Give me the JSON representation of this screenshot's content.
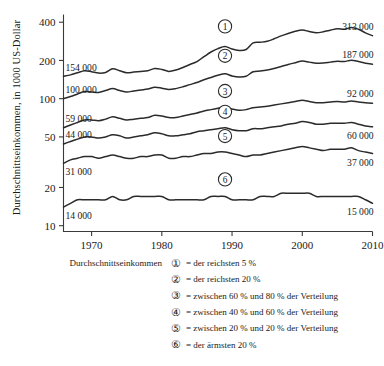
{
  "chart_data": {
    "type": "line",
    "title": "",
    "xlabel": "",
    "ylabel": "Durchschnittseinkommen, in 1000 US-Dollar",
    "xlim": [
      1966,
      2010
    ],
    "ylim": [
      9,
      460
    ],
    "yscale": "log",
    "grid": false,
    "legend_position": "below",
    "xticks": [
      "1970",
      "1980",
      "1990",
      "2000",
      "2010"
    ],
    "xtick_values": [
      1970,
      1980,
      1990,
      2000,
      2010
    ],
    "yticks": [
      "10",
      "20",
      "50",
      "100",
      "200",
      "400"
    ],
    "ytick_values": [
      10,
      20,
      50,
      100,
      200,
      400
    ],
    "series": [
      {
        "name": "1",
        "marker_label": "1",
        "start_label": "154 000",
        "end_label": "313 000",
        "start_value": 154,
        "end_value": 313,
        "x": [
          1966,
          1967,
          1968,
          1969,
          1970,
          1971,
          1972,
          1973,
          1974,
          1975,
          1976,
          1977,
          1978,
          1979,
          1980,
          1981,
          1982,
          1983,
          1984,
          1985,
          1986,
          1987,
          1988,
          1989,
          1990,
          1991,
          1992,
          1993,
          1994,
          1995,
          1996,
          1997,
          1998,
          1999,
          2000,
          2001,
          2002,
          2003,
          2004,
          2005,
          2006,
          2007,
          2008,
          2009,
          2010
        ],
        "values": [
          150,
          154,
          160,
          166,
          163,
          159,
          161,
          172,
          166,
          160,
          162,
          164,
          166,
          173,
          170,
          164,
          168,
          176,
          186,
          196,
          214,
          233,
          248,
          258,
          246,
          240,
          244,
          275,
          278,
          283,
          296,
          312,
          326,
          339,
          347,
          338,
          330,
          336,
          346,
          356,
          352,
          364,
          352,
          330,
          313
        ]
      },
      {
        "name": "2",
        "marker_label": "2",
        "start_label": "100 000",
        "end_label": "187 000",
        "start_value": 100,
        "end_value": 187,
        "x": [
          1966,
          1967,
          1968,
          1969,
          1970,
          1971,
          1972,
          1973,
          1974,
          1975,
          1976,
          1977,
          1978,
          1979,
          1980,
          1981,
          1982,
          1983,
          1984,
          1985,
          1986,
          1987,
          1988,
          1989,
          1990,
          1991,
          1992,
          1993,
          1994,
          1995,
          1996,
          1997,
          1998,
          1999,
          2000,
          2001,
          2002,
          2003,
          2004,
          2005,
          2006,
          2007,
          2008,
          2009,
          2010
        ],
        "values": [
          100,
          104,
          109,
          114,
          113,
          112,
          116,
          120,
          116,
          113,
          115,
          117,
          119,
          123,
          121,
          118,
          120,
          124,
          129,
          134,
          141,
          147,
          153,
          157,
          151,
          148,
          150,
          163,
          165,
          168,
          173,
          179,
          186,
          192,
          198,
          194,
          190,
          191,
          194,
          197,
          196,
          201,
          196,
          190,
          187
        ]
      },
      {
        "name": "3",
        "marker_label": "3",
        "start_label": "59 000",
        "end_label": "92 000",
        "start_value": 59,
        "end_value": 92,
        "x": [
          1966,
          1967,
          1968,
          1969,
          1970,
          1971,
          1972,
          1973,
          1974,
          1975,
          1976,
          1977,
          1978,
          1979,
          1980,
          1981,
          1982,
          1983,
          1984,
          1985,
          1986,
          1987,
          1988,
          1989,
          1990,
          1991,
          1992,
          1993,
          1994,
          1995,
          1996,
          1997,
          1998,
          1999,
          2000,
          2001,
          2002,
          2003,
          2004,
          2005,
          2006,
          2007,
          2008,
          2009,
          2010
        ],
        "values": [
          59,
          62,
          65,
          68,
          68,
          67,
          69,
          72,
          70,
          68,
          69,
          70,
          71,
          74,
          73,
          71,
          71,
          73,
          75,
          77,
          80,
          82,
          84,
          86,
          83,
          81,
          82,
          85,
          86,
          87,
          89,
          91,
          93,
          95,
          97,
          95,
          93,
          93,
          94,
          95,
          94,
          96,
          94,
          93,
          92
        ]
      },
      {
        "name": "4",
        "marker_label": "4",
        "start_label": "44 000",
        "end_label": "60 000",
        "start_value": 44,
        "end_value": 60,
        "x": [
          1966,
          1967,
          1968,
          1969,
          1970,
          1971,
          1972,
          1973,
          1974,
          1975,
          1976,
          1977,
          1978,
          1979,
          1980,
          1981,
          1982,
          1983,
          1984,
          1985,
          1986,
          1987,
          1988,
          1989,
          1990,
          1991,
          1992,
          1993,
          1994,
          1995,
          1996,
          1997,
          1998,
          1999,
          2000,
          2001,
          2002,
          2003,
          2004,
          2005,
          2006,
          2007,
          2008,
          2009,
          2010
        ],
        "values": [
          44,
          46,
          48,
          50,
          50,
          49,
          50,
          52,
          51,
          49,
          50,
          51,
          52,
          54,
          53,
          51,
          51,
          52,
          53,
          55,
          56,
          57,
          58,
          59,
          57,
          56,
          56,
          58,
          58,
          59,
          60,
          61,
          63,
          64,
          66,
          65,
          63,
          63,
          64,
          64,
          64,
          65,
          63,
          61,
          60
        ]
      },
      {
        "name": "5",
        "marker_label": "5",
        "start_label": "31 000",
        "end_label": "37 000",
        "start_value": 31,
        "end_value": 37,
        "x": [
          1966,
          1967,
          1968,
          1969,
          1970,
          1971,
          1972,
          1973,
          1974,
          1975,
          1976,
          1977,
          1978,
          1979,
          1980,
          1981,
          1982,
          1983,
          1984,
          1985,
          1986,
          1987,
          1988,
          1989,
          1990,
          1991,
          1992,
          1993,
          1994,
          1995,
          1996,
          1997,
          1998,
          1999,
          2000,
          2001,
          2002,
          2003,
          2004,
          2005,
          2006,
          2007,
          2008,
          2009,
          2010
        ],
        "values": [
          31,
          33,
          34,
          35,
          35,
          34,
          35,
          36,
          35,
          34,
          34,
          35,
          35,
          36,
          36,
          34,
          34,
          35,
          35,
          36,
          37,
          37,
          38,
          38,
          37,
          36,
          35,
          36,
          36,
          37,
          38,
          39,
          40,
          41,
          42,
          41,
          40,
          39,
          40,
          40,
          40,
          41,
          39,
          38,
          37
        ]
      },
      {
        "name": "6",
        "marker_label": "6",
        "start_label": "14 000",
        "end_label": "15 000",
        "start_value": 14,
        "end_value": 15,
        "x": [
          1966,
          1967,
          1968,
          1969,
          1970,
          1971,
          1972,
          1973,
          1974,
          1975,
          1976,
          1977,
          1978,
          1979,
          1980,
          1981,
          1982,
          1983,
          1984,
          1985,
          1986,
          1987,
          1988,
          1989,
          1990,
          1991,
          1992,
          1993,
          1994,
          1995,
          1996,
          1997,
          1998,
          1999,
          2000,
          2001,
          2002,
          2003,
          2004,
          2005,
          2006,
          2007,
          2008,
          2009,
          2010
        ],
        "values": [
          14,
          15,
          16,
          16,
          16,
          16,
          16,
          17,
          16,
          16,
          17,
          17,
          17,
          17,
          17,
          16,
          16,
          16,
          16,
          16,
          16,
          17,
          17,
          17,
          16,
          16,
          16,
          16,
          17,
          17,
          17,
          18,
          18,
          18,
          18,
          18,
          17,
          17,
          17,
          17,
          17,
          17,
          17,
          16,
          15
        ]
      }
    ]
  },
  "legend": {
    "caption": "Durchschnittseinkommen",
    "rows": [
      {
        "marker": "①",
        "text": "= der reichsten 5 %"
      },
      {
        "marker": "②",
        "text": "= der reichsten 20 %"
      },
      {
        "marker": "③",
        "text": "= zwischen 60 % und 80 % der Verteilung"
      },
      {
        "marker": "④",
        "text": "= zwischen 40 % und 60 % der Verteilung"
      },
      {
        "marker": "⑤",
        "text": "= zwischen 20 % und 20 % der Verteilung"
      },
      {
        "marker": "⑥",
        "text": "= der ärmsten 20 %"
      }
    ]
  },
  "colors": {
    "line": "#2b2b2b",
    "axis": "#3a3a3a",
    "text": "#1a1a1a",
    "background": "#ffffff"
  }
}
